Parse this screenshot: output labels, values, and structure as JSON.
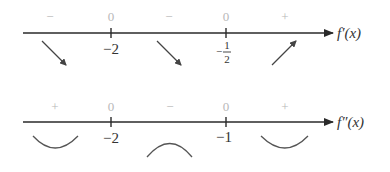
{
  "first_derivative_line": {
    "function_label": "f′(x)",
    "critical_points": [
      {
        "label": "−2",
        "value_at_point": "0"
      },
      {
        "label_numerator": "1",
        "label_denominator": "2",
        "label_sign": "−",
        "value_at_point": "0"
      }
    ],
    "intervals": [
      {
        "sign": "−",
        "behavior": "decreasing",
        "icon": "arrow-down-right"
      },
      {
        "sign": "−",
        "behavior": "decreasing",
        "icon": "arrow-down-right"
      },
      {
        "sign": "+",
        "behavior": "increasing",
        "icon": "arrow-up-right"
      }
    ]
  },
  "second_derivative_line": {
    "function_label": "f″(x)",
    "critical_points": [
      {
        "label": "−2",
        "value_at_point": "0"
      },
      {
        "label": "−1",
        "value_at_point": "0"
      }
    ],
    "intervals": [
      {
        "sign": "+",
        "concavity": "concave up",
        "icon": "cup-up"
      },
      {
        "sign": "−",
        "concavity": "concave down",
        "icon": "cap-down"
      },
      {
        "sign": "+",
        "concavity": "concave up",
        "icon": "cup-up"
      }
    ]
  },
  "colors": {
    "axis": "#2a2a2a",
    "sign": "#b8b8b8",
    "text": "#333333"
  }
}
